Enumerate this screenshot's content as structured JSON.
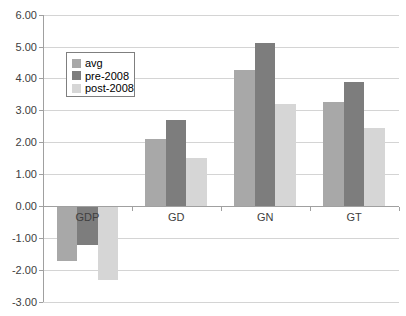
{
  "chart_data": {
    "type": "bar",
    "title": "",
    "xlabel": "",
    "ylabel": "",
    "categories": [
      "GDP",
      "GD",
      "GN",
      "GT"
    ],
    "series": [
      {
        "name": "avg",
        "color": "#a8a8a8",
        "values": [
          -1.7,
          2.1,
          4.25,
          3.25
        ]
      },
      {
        "name": "pre-2008",
        "color": "#7d7d7d",
        "values": [
          -1.2,
          2.7,
          5.1,
          3.9
        ]
      },
      {
        "name": "post-2008",
        "color": "#d6d6d6",
        "values": [
          -2.3,
          1.5,
          3.2,
          2.45
        ]
      }
    ],
    "ylim": [
      -3,
      6
    ],
    "yticks": [
      {
        "value": 6,
        "label": "6.00"
      },
      {
        "value": 5,
        "label": "5.00"
      },
      {
        "value": 4,
        "label": "4.00"
      },
      {
        "value": 3,
        "label": "3.00"
      },
      {
        "value": 2,
        "label": "2.00"
      },
      {
        "value": 1,
        "label": "1.00"
      },
      {
        "value": 0,
        "label": "0.00"
      },
      {
        "value": -1,
        "label": "-1.00"
      },
      {
        "value": -2,
        "label": "-2.00"
      },
      {
        "value": -3,
        "label": "-3.00"
      }
    ],
    "grid": true,
    "legend_position": "inside-upper-left",
    "colors": {
      "background": "#ffffff",
      "gridline": "#d4d4d4",
      "axis": "#a0a0a0",
      "text": "#404040",
      "legend_border": "#7f7f7f"
    }
  }
}
